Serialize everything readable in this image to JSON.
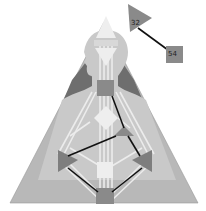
{
  "diagram": {
    "type": "human-design-bodygraph",
    "colors": {
      "background": "#ffffff",
      "outer_triangle": "#b8b8b8",
      "shoulder_dark": "#6e6e6e",
      "body_silhouette": "#c9c9c9",
      "channel_open": "#e8e8e8",
      "channel_defined": "#111111",
      "center_defined": "#8a8a8a",
      "center_open": "#eeeeee"
    },
    "floating_gates": [
      {
        "id": "gate-32",
        "label": "32",
        "shape": "triangle"
      },
      {
        "id": "gate-54",
        "label": "54",
        "shape": "square"
      }
    ]
  }
}
